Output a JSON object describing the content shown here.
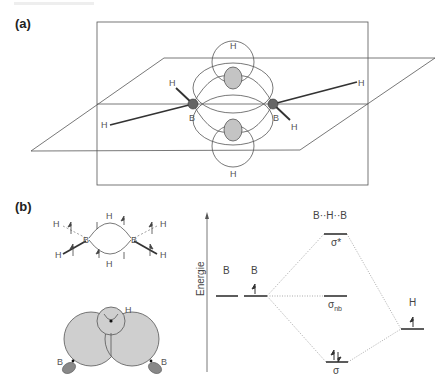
{
  "figure": {
    "panel_a": {
      "label": "(a)",
      "atoms": {
        "boron_left": "B",
        "boron_right": "B",
        "h_bridge_top": "H",
        "h_bridge_bottom": "H",
        "h_terminal_left_up": "H",
        "h_terminal_left_down": "H",
        "h_terminal_right_up": "H",
        "h_terminal_right_down": "H"
      }
    },
    "panel_b": {
      "label": "(b)",
      "structure": {
        "boron_left": "B",
        "boron_right": "B",
        "h_bridge_top": "H",
        "h_bridge_bottom": "H",
        "h_left_top": "H",
        "h_left_bottom": "H",
        "h_right_top": "H",
        "h_right_bottom": "H"
      },
      "orbital_overlap": {
        "h_label": "H",
        "b_left_label": "B",
        "b_right_label": "B"
      },
      "mo_diagram": {
        "axis_label": "Energie",
        "left_fragment_1": "B",
        "left_fragment_2": "B",
        "center_title": "B··H··B",
        "right_fragment": "H",
        "levels": {
          "antibonding": "σ*",
          "nonbonding": "σ",
          "nonbonding_sub": "nb",
          "bonding": "σ"
        },
        "electrons": {
          "b2_level": "up",
          "h_level": "up",
          "bonding_level": "paired"
        }
      }
    }
  }
}
